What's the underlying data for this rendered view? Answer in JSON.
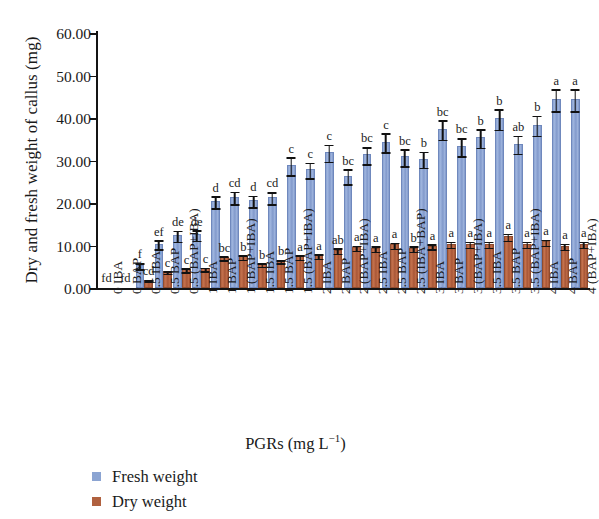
{
  "chart_data": {
    "type": "bar",
    "title": "",
    "xlabel": "PGRs (mg L−1)",
    "ylabel": "Dry and fresh weight of callus (mg)",
    "ylim": [
      0,
      60
    ],
    "ytick_labels": [
      "60.00",
      "50.00",
      "40.00",
      "30.00",
      "20.00",
      "10.00",
      "0.00"
    ],
    "ytick_values": [
      60,
      50,
      40,
      30,
      20,
      10,
      0
    ],
    "grid": false,
    "legend_position": "bottom-left",
    "categories": [
      "0 IBA",
      "0 BAP",
      "0.5 IBA",
      "0.5 BAP",
      "0.5 (BAP+IBA)",
      "1 IBA",
      "1 BAP",
      "1 (BAP+IBA)",
      "1.5 IBA",
      "1.5 BAP",
      "1.5 (BAP+IBA)",
      "2 IBA",
      "2 BAP",
      "2 (BAP+IBA)",
      "2.5 IBA",
      "2.5 BAP",
      "2.5 (IBA+BAP)",
      "3 IBA",
      "3 BAP",
      "3 (BAP+IBA)",
      "3.5 IBA",
      "3.5 BAP",
      "3.5 (BAP+IBA)",
      "4 IBA",
      "4 BAP",
      "4 (BAP+IBA)"
    ],
    "series": [
      {
        "name": "Fresh weight",
        "color": "#8ba4d2",
        "values": [
          0,
          0,
          5.0,
          10.0,
          12.0,
          12.2,
          20.0,
          21.0,
          20.2,
          21.0,
          28.5,
          27.5,
          31.5,
          26.0,
          31.0,
          34.0,
          30.5,
          30.0,
          37.0,
          33.0,
          35.0,
          39.5,
          33.5,
          38.0,
          44.0,
          44.0
        ],
        "errors": [
          0,
          0,
          0.9,
          1.2,
          1.5,
          1.4,
          1.6,
          1.7,
          1.5,
          1.6,
          2.3,
          2.0,
          2.2,
          2.0,
          2.2,
          2.4,
          2.2,
          2.1,
          2.5,
          2.3,
          2.4,
          2.6,
          2.3,
          2.5,
          2.8,
          2.8
        ],
        "letters": [
          "fd",
          "fd",
          "f",
          "ef",
          "de",
          "de",
          "d",
          "cd",
          "d",
          "cd",
          "c",
          "c",
          "c",
          "bc",
          "bc",
          "c",
          "bc",
          "b",
          "bc",
          "bc",
          "b",
          "b",
          "ab",
          "b",
          "a",
          "a"
        ]
      },
      {
        "name": "Dry weight",
        "color": "#b0613f",
        "values": [
          0,
          0,
          1.5,
          3.5,
          4.0,
          4.2,
          6.8,
          7.0,
          5.2,
          6.0,
          7.0,
          7.2,
          8.5,
          9.2,
          9.0,
          9.8,
          9.0,
          9.5,
          10.0,
          10.0,
          10.0,
          11.8,
          10.0,
          10.5,
          9.5,
          10.0
        ],
        "errors": [
          0,
          0,
          0.4,
          0.5,
          0.6,
          0.6,
          0.7,
          0.7,
          0.6,
          0.6,
          0.7,
          0.7,
          0.8,
          0.8,
          0.8,
          0.9,
          0.8,
          0.8,
          0.9,
          0.9,
          0.9,
          1.0,
          0.9,
          0.9,
          0.9,
          0.9
        ],
        "letters": [
          "",
          "",
          "cd",
          "c",
          "c",
          "c",
          "bc",
          "b",
          "b",
          "b",
          "a",
          "a",
          "ab",
          "a",
          "a",
          "a",
          "b",
          "a",
          "a",
          "a",
          "a",
          "a",
          "a",
          "a",
          "a",
          "a"
        ]
      }
    ],
    "zero_annotations": [
      "fd",
      "fd"
    ]
  },
  "legend": {
    "items": [
      {
        "label": "Fresh weight",
        "key": "fresh"
      },
      {
        "label": "Dry weight",
        "key": "dry"
      }
    ]
  },
  "axis_title": {
    "x_main": "PGRs (mg L",
    "x_sup": "−1",
    "x_close": ")",
    "y": "Dry and fresh weight of callus (mg)"
  }
}
